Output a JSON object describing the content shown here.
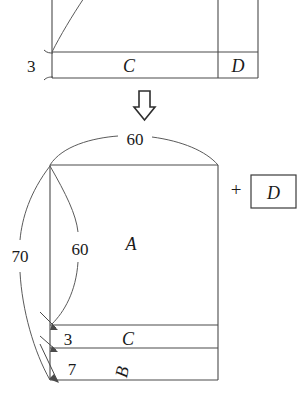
{
  "figure": {
    "title_text": "",
    "colors": {
      "ink": "#3a3a3a",
      "line": "#4a4a4a",
      "background": "#ffffff"
    },
    "top_diagram": {
      "name": "upper-partial-rectangle",
      "labels": {
        "left_measure": "3",
        "region_c": "C",
        "region_d": "D"
      }
    },
    "transform_arrow": {
      "glyph": "arrow-down",
      "direction": "down"
    },
    "bottom_diagram": {
      "name": "lower-rectangle-decomposition",
      "labels": {
        "top_arc": "60",
        "left_outer_arc": "70",
        "left_inner_arc": "60",
        "region_a": "A",
        "measure_c": "3",
        "region_c": "C",
        "measure_b": "7",
        "region_b": "B"
      },
      "appendix": {
        "operator": "+",
        "boxed_region": "D"
      }
    }
  }
}
